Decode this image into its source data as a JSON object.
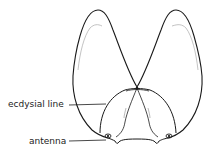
{
  "diagram": {
    "labels": [
      {
        "id": "ecdysial-line",
        "text": "ecdysial line"
      },
      {
        "id": "antenna",
        "text": "antenna"
      }
    ],
    "colors": {
      "line": "#1a1a1a",
      "faint_line": "#9a9a9a",
      "background": "#ffffff"
    }
  }
}
